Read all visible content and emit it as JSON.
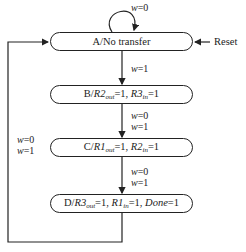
{
  "diagram": {
    "type": "state-machine",
    "states": [
      {
        "id": "A",
        "label": "A/No transfer",
        "prefix": "A/",
        "text": "No transfer"
      },
      {
        "id": "B",
        "label": "B/R2out=1, R3in=1",
        "prefix": "B/",
        "parts": [
          "R2",
          "out",
          "=1, ",
          "R3",
          "in",
          "=1"
        ]
      },
      {
        "id": "C",
        "label": "C/R1out=1, R2in=1",
        "prefix": "C/",
        "parts": [
          "R1",
          "out",
          "=1, ",
          "R2",
          "in",
          "=1"
        ]
      },
      {
        "id": "D",
        "label": "D/R3out=1, R1in=1, Done=1",
        "prefix": "D/",
        "parts": [
          "R3",
          "out",
          "=1, ",
          "R1",
          "in",
          "=1, ",
          "Done",
          "=1"
        ]
      }
    ],
    "transitions": [
      {
        "from": "A",
        "to": "A",
        "label": "w=0"
      },
      {
        "from": "A",
        "to": "B",
        "label": "w=1"
      },
      {
        "from": "B",
        "to": "C",
        "label": [
          "w=0",
          "w=1"
        ]
      },
      {
        "from": "C",
        "to": "D",
        "label": [
          "w=0",
          "w=1"
        ]
      },
      {
        "from": "D",
        "to": "A",
        "label": [
          "w=0",
          "w=1"
        ]
      }
    ],
    "reset_label": "Reset",
    "labels": {
      "self_loop_w": "w",
      "self_loop_val": "=0",
      "ab_w": "w",
      "ab_val": "=1",
      "bc_w0": "w",
      "bc_v0": "=0",
      "bc_w1": "w",
      "bc_v1": "=1",
      "cd_w0": "w",
      "cd_v0": "=0",
      "cd_w1": "w",
      "cd_v1": "=1",
      "da_w0": "w",
      "da_v0": "=0",
      "da_w1": "w",
      "da_v1": "=1"
    }
  }
}
